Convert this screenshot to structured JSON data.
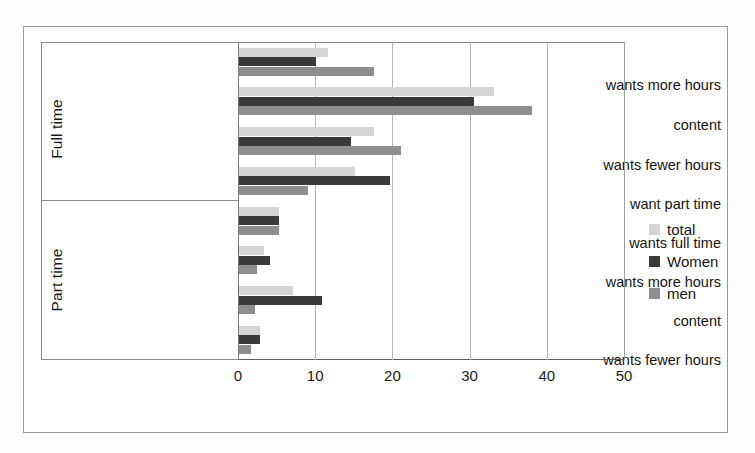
{
  "chart_data": {
    "type": "bar",
    "orientation": "horizontal",
    "title": "",
    "xlabel": "",
    "ylabel": "",
    "xlim": [
      0,
      50
    ],
    "xticks": [
      0,
      10,
      20,
      30,
      40,
      50
    ],
    "grid": true,
    "legend_position": "right",
    "groups": [
      {
        "name": "Full time",
        "categories": [
          "wants more hours",
          "content",
          "wants fewer hours",
          "want part time"
        ]
      },
      {
        "name": "Part time",
        "categories": [
          "wants full time",
          "wants more hours",
          "content",
          "wants fewer hours"
        ]
      }
    ],
    "categories": [
      "wants more hours",
      "content",
      "wants fewer hours",
      "want part time",
      "wants full time",
      "wants more hours",
      "content",
      "wants fewer hours"
    ],
    "series": [
      {
        "name": "total",
        "color": "#d5d5d5",
        "values": [
          11.5,
          33.0,
          17.5,
          15.0,
          5.2,
          3.3,
          7.0,
          2.7
        ]
      },
      {
        "name": "Women",
        "color": "#3a3a3a",
        "values": [
          10.0,
          30.5,
          14.5,
          19.6,
          5.2,
          4.0,
          10.8,
          2.7
        ]
      },
      {
        "name": "men",
        "color": "#8e8e8e",
        "values": [
          17.5,
          38.0,
          21.0,
          9.0,
          5.2,
          2.3,
          2.1,
          1.5
        ]
      }
    ]
  },
  "legend": {
    "entries": [
      {
        "label": "total",
        "color": "#d5d5d5"
      },
      {
        "label": "Women",
        "color": "#3a3a3a"
      },
      {
        "label": "men",
        "color": "#8e8e8e"
      }
    ]
  },
  "axis": {
    "tick_labels": [
      "0",
      "10",
      "20",
      "30",
      "40",
      "50"
    ]
  },
  "labels": {
    "group_full": "Full time",
    "group_part": "Part time",
    "full_0": "wants more hours",
    "full_1": "content",
    "full_2": "wants fewer hours",
    "full_3": "want part time",
    "part_0": "wants full time",
    "part_1": "wants more hours",
    "part_2": "content",
    "part_3": "wants fewer hours"
  }
}
